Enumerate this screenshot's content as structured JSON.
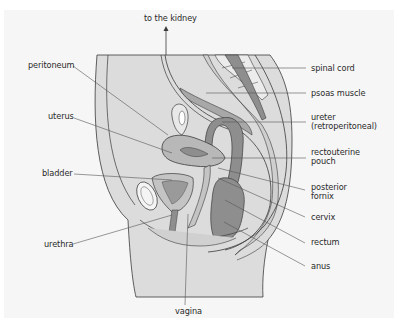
{
  "diagram": {
    "type": "anatomical-cross-section",
    "colors": {
      "background": "#f6f6f6",
      "tissue_light": "#dcdcdc",
      "tissue_mid": "#c4c4c4",
      "organ_dark": "#8e8e8e",
      "organ_mid": "#a8a8a8",
      "outline": "#3a3a3a",
      "leader_line": "#555555",
      "text": "#2b2b2b"
    },
    "labels": {
      "to_kidney": "to the kidney",
      "peritoneum": "peritoneum",
      "uterus": "uterus",
      "bladder": "bladder",
      "urethra": "urethra",
      "vagina": "vagina",
      "spinal_cord": "spinal cord",
      "psoas_muscle": "psoas muscle",
      "ureter_line1": "ureter",
      "ureter_line2": "(retroperitoneal)",
      "rectouterine_line1": "rectouterine",
      "rectouterine_line2": "pouch",
      "posterior_fornix_line1": "posterior",
      "posterior_fornix_line2": "fornix",
      "cervix": "cervix",
      "rectum": "rectum",
      "anus": "anus"
    }
  }
}
